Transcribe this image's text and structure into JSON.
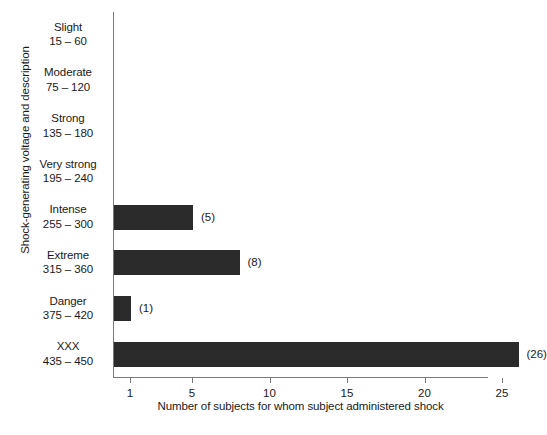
{
  "chart_data": {
    "type": "bar",
    "orientation": "horizontal",
    "title": "",
    "xlabel": "Number of subjects for whom subject administered shock",
    "ylabel": "Shock-generating voltage and description",
    "categories": [
      "Slight",
      "Moderate",
      "Strong",
      "Very strong",
      "Intense",
      "Extreme",
      "Danger",
      "XXX"
    ],
    "category_ranges": [
      "15 – 60",
      "75 – 120",
      "135 – 180",
      "195 – 240",
      "255 – 300",
      "315 – 360",
      "375 – 420",
      "435 – 450"
    ],
    "values": [
      0,
      0,
      0,
      0,
      5,
      8,
      1,
      26
    ],
    "value_labels": [
      "",
      "",
      "",
      "",
      "(5)",
      "(8)",
      "(1)",
      "(26)"
    ],
    "xticks": [
      1,
      5,
      10,
      15,
      20,
      25
    ],
    "xtick_labels": [
      "1",
      "5",
      "10",
      "15",
      "20",
      "25"
    ],
    "xlim": [
      0,
      28
    ],
    "grid": false,
    "legend": false,
    "bar_color": "#2b2b2b",
    "axis_color": "#7a7a7a"
  }
}
